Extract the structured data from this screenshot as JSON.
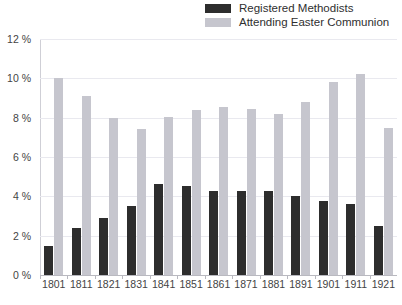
{
  "chart_data": {
    "type": "bar",
    "title": "",
    "subtitle": "",
    "xlabel": "",
    "ylabel": "",
    "grid": true,
    "legend_position": "top-right",
    "categories": [
      "1801",
      "1811",
      "1821",
      "1831",
      "1841",
      "1851",
      "1861",
      "1871",
      "1881",
      "1891",
      "1901",
      "1911",
      "1921"
    ],
    "ylim": [
      0,
      12
    ],
    "yticks": [
      0,
      2,
      4,
      6,
      8,
      10,
      12
    ],
    "ytick_labels": [
      "0 %",
      "2 %",
      "4 %",
      "6 %",
      "8 %",
      "10 %",
      "12 %"
    ],
    "series": [
      {
        "name": "Registered Methodists",
        "color": "#2d2d2d",
        "values": [
          1.5,
          2.4,
          2.9,
          3.5,
          4.65,
          4.55,
          4.25,
          4.25,
          4.25,
          4.0,
          3.75,
          3.6,
          2.5
        ]
      },
      {
        "name": "Attending Easter Communion",
        "color": "#c6c6ce",
        "values": [
          10.0,
          9.1,
          8.0,
          7.4,
          8.05,
          8.4,
          8.55,
          8.45,
          8.2,
          8.8,
          9.8,
          10.2,
          7.5
        ]
      }
    ]
  },
  "legend": {
    "items": [
      {
        "label": "Registered Methodists",
        "swatch_name": "legend-swatch-registered-methodists"
      },
      {
        "label": "Attending Easter Communion",
        "swatch_name": "legend-swatch-attending-easter-communion"
      }
    ]
  }
}
